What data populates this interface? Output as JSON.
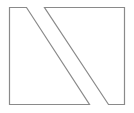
{
  "diagram": {
    "background": "#ffffff",
    "stroke_color": "#8a8a8a",
    "stroke_width": 1.2,
    "shapes": [
      {
        "name": "left-quadrilateral",
        "points": "9.5,7.5 26.5,7.5 89.5,104.5 9.5,104.5"
      },
      {
        "name": "right-quadrilateral",
        "points": "44.5,7.5 124.5,7.5 124.5,104.5 108.5,104.5"
      }
    ]
  }
}
